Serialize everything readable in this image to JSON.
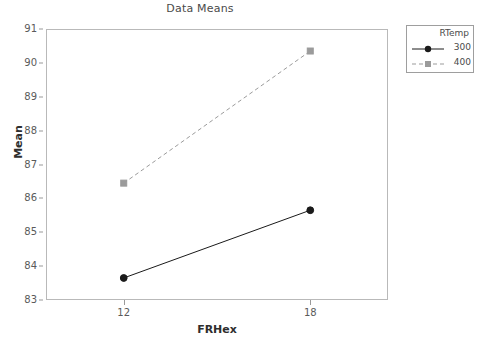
{
  "chart_data": {
    "type": "line",
    "title": "Data Means",
    "xlabel": "FRHex",
    "ylabel": "Mean",
    "categories": [
      "12",
      "18"
    ],
    "x": [
      12,
      18
    ],
    "xlim": [
      9.5,
      20.5
    ],
    "ylim": [
      83,
      91
    ],
    "yticks": [
      "83",
      "84",
      "85",
      "86",
      "87",
      "88",
      "89",
      "90",
      "91"
    ],
    "ytick_values": [
      83,
      84,
      85,
      86,
      87,
      88,
      89,
      90,
      91
    ],
    "grid": false,
    "legend_position": "right-outside",
    "legend_title": "RTemp",
    "series": [
      {
        "name": "300",
        "values": [
          83.65,
          85.65
        ],
        "color": "#1a1a1a",
        "line_style": "solid",
        "marker": "circle"
      },
      {
        "name": "400",
        "values": [
          86.45,
          90.35
        ],
        "color": "#9b9b9b",
        "line_style": "dashed",
        "marker": "square"
      }
    ]
  },
  "chart": {
    "title": "Data Means",
    "y_axis_title": "Mean",
    "x_axis_title": "FRHex",
    "x_tick_labels": [
      "12",
      "18"
    ],
    "y_tick_labels": [
      "83",
      "84",
      "85",
      "86",
      "87",
      "88",
      "89",
      "90",
      "91"
    ]
  },
  "legend": {
    "title": "RTemp",
    "entries": [
      {
        "label": "300"
      },
      {
        "label": "400"
      }
    ]
  },
  "colors": {
    "series_300": "#1a1a1a",
    "series_400": "#9b9b9b",
    "frame": "#b9b9b9",
    "text": "#4a4a4a"
  }
}
